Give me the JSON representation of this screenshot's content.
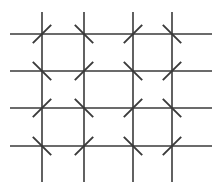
{
  "figure": {
    "background_color": "#ffffff",
    "stroke_color": "#3a3a3a",
    "canvas": {
      "width": 224,
      "height": 192
    }
  },
  "chart_data": {
    "type": "scatter",
    "xlabel": "",
    "ylabel": "",
    "xlim": [
      0,
      224
    ],
    "ylim": [
      0,
      192
    ],
    "grid": true,
    "legend": "none",
    "annotations": [],
    "grid_lines": {
      "vertical_x": [
        42,
        84,
        133,
        172
      ],
      "vertical_span_y": [
        12,
        182
      ],
      "horizontal_y": [
        34,
        71,
        108,
        146
      ],
      "horizontal_span_x": [
        10,
        212
      ],
      "stroke_width": 1.6,
      "color": "#3a3a3a"
    },
    "tick_marks": {
      "length": 26,
      "stroke_width": 1.9,
      "color": "#3a3a3a",
      "orientation_key": {
        "NE": "diagonal rising from lower-left to upper-right",
        "NW": "diagonal falling from upper-left to lower-right"
      },
      "rows": [
        {
          "row": 1,
          "y": 34,
          "orientations": [
            "NE",
            "NW",
            "NE",
            "NW"
          ]
        },
        {
          "row": 2,
          "y": 71,
          "orientations": [
            "NW",
            "NE",
            "NW",
            "NE"
          ]
        },
        {
          "row": 3,
          "y": 108,
          "orientations": [
            "NE",
            "NW",
            "NE",
            "NW"
          ]
        },
        {
          "row": 4,
          "y": 146,
          "orientations": [
            "NW",
            "NE",
            "NW",
            "NE"
          ]
        }
      ]
    },
    "intersections": [
      {
        "id": "r1c1",
        "x": 42,
        "y": 34,
        "orientation": "NE"
      },
      {
        "id": "r1c2",
        "x": 84,
        "y": 34,
        "orientation": "NW"
      },
      {
        "id": "r1c3",
        "x": 133,
        "y": 34,
        "orientation": "NE"
      },
      {
        "id": "r1c4",
        "x": 172,
        "y": 34,
        "orientation": "NW"
      },
      {
        "id": "r2c1",
        "x": 42,
        "y": 71,
        "orientation": "NW"
      },
      {
        "id": "r2c2",
        "x": 84,
        "y": 71,
        "orientation": "NE"
      },
      {
        "id": "r2c3",
        "x": 133,
        "y": 71,
        "orientation": "NW"
      },
      {
        "id": "r2c4",
        "x": 172,
        "y": 71,
        "orientation": "NE"
      },
      {
        "id": "r3c1",
        "x": 42,
        "y": 108,
        "orientation": "NE"
      },
      {
        "id": "r3c2",
        "x": 84,
        "y": 108,
        "orientation": "NW"
      },
      {
        "id": "r3c3",
        "x": 133,
        "y": 108,
        "orientation": "NE"
      },
      {
        "id": "r3c4",
        "x": 172,
        "y": 108,
        "orientation": "NW"
      },
      {
        "id": "r4c1",
        "x": 42,
        "y": 146,
        "orientation": "NW"
      },
      {
        "id": "r4c2",
        "x": 84,
        "y": 146,
        "orientation": "NE"
      },
      {
        "id": "r4c3",
        "x": 133,
        "y": 146,
        "orientation": "NW"
      },
      {
        "id": "r4c4",
        "x": 172,
        "y": 146,
        "orientation": "NE"
      }
    ],
    "counts": {
      "vertical_lines": 4,
      "horizontal_lines": 4,
      "intersections": 16,
      "ne_ticks": 8,
      "nw_ticks": 8
    }
  }
}
